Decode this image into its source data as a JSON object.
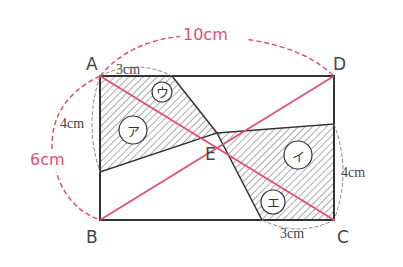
{
  "diagram": {
    "type": "geometry-rectangle",
    "colors": {
      "outline": "#333333",
      "diagonal": "#e0506e",
      "dimension_red": "#e0506e",
      "dimension_gray": "#888888",
      "hatch": "#555555"
    },
    "vertices": {
      "A": "A",
      "B": "B",
      "C": "C",
      "D": "D",
      "E": "E"
    },
    "dimensions": {
      "width": "10cm",
      "height": "6cm",
      "top_segment": "3cm",
      "left_segment": "4cm",
      "bottom_segment": "3cm",
      "right_segment": "4cm"
    },
    "regions": {
      "a": "ア",
      "i": "イ",
      "u": "ウ",
      "e": "エ"
    }
  }
}
